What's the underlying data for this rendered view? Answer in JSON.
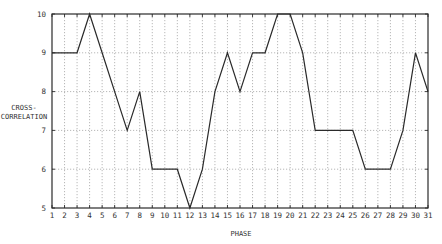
{
  "chart_data": {
    "type": "line",
    "title": "",
    "xlabel": "PHASE",
    "ylabel": [
      "CROSS-",
      "CORRELATION"
    ],
    "x": [
      1,
      2,
      3,
      4,
      5,
      6,
      7,
      8,
      9,
      10,
      11,
      12,
      13,
      14,
      15,
      16,
      17,
      18,
      19,
      20,
      21,
      22,
      23,
      24,
      25,
      26,
      27,
      28,
      29,
      30,
      31
    ],
    "series": [
      {
        "name": "cross-correlation",
        "values": [
          9,
          9,
          9,
          10,
          9,
          8,
          7,
          8,
          6,
          6,
          6,
          5,
          6,
          8,
          9,
          8,
          9,
          9,
          10,
          10,
          9,
          7,
          7,
          7,
          7,
          6,
          6,
          6,
          7,
          9,
          8
        ]
      }
    ],
    "xlim": [
      1,
      31
    ],
    "ylim": [
      5,
      10
    ],
    "x_ticks": [
      "1",
      "2",
      "3",
      "4",
      "5",
      "6",
      "7",
      "8",
      "9",
      "10",
      "11",
      "12",
      "13",
      "14",
      "15",
      "16",
      "17",
      "18",
      "19",
      "20",
      "21",
      "22",
      "23",
      "24",
      "25",
      "26",
      "27",
      "28",
      "29",
      "30",
      "31"
    ],
    "y_ticks": [
      "5",
      "6",
      "7",
      "8",
      "9",
      "10"
    ],
    "grid": true,
    "legend": null
  },
  "colors": {
    "line": "#2a2a2a",
    "axis": "#2a2a2a",
    "grid": "#9a9a9a"
  }
}
